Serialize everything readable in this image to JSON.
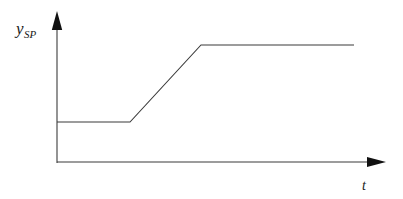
{
  "figure": {
    "name": "setpoint-ramp-diagram",
    "background_color": "#ffffff",
    "line_color": "#3b3b3b",
    "arrow_color": "#111111",
    "text_color": "#1a1a1a"
  },
  "axes": {
    "y": {
      "label_base": "y",
      "label_sub": "SP",
      "arrow": "up-arrow-icon"
    },
    "x": {
      "label": "t",
      "arrow": "right-arrow-icon"
    }
  },
  "chart_data": {
    "type": "line",
    "title": "",
    "subtitle": "",
    "xlabel": "t",
    "ylabel": "y_SP",
    "grid": false,
    "legend": null,
    "axis_style": "arrow-axes",
    "xlim": [
      0,
      10
    ],
    "ylim": [
      0,
      10
    ],
    "series": [
      {
        "name": "y_SP",
        "x": [
          0.0,
          2.2,
          4.4,
          9.1
        ],
        "y": [
          3.4,
          3.4,
          8.0,
          8.0
        ],
        "color": "#3b3b3b",
        "shape": "hold-ramp-hold",
        "annotations": [
          {
            "label": "initial setpoint hold",
            "x": 1.1,
            "y": 3.4
          },
          {
            "label": "linear ramp",
            "x": 3.3,
            "y": 5.7
          },
          {
            "label": "final setpoint hold",
            "x": 6.8,
            "y": 8.0
          }
        ]
      }
    ]
  },
  "geometry": {
    "origin_px": [
      57,
      162
    ],
    "y_axis_top_px": [
      57,
      12
    ],
    "x_axis_right_px": [
      385,
      162
    ],
    "signal_points_px": [
      [
        57,
        122
      ],
      [
        130,
        122
      ],
      [
        201,
        45
      ],
      [
        354,
        45
      ]
    ]
  }
}
